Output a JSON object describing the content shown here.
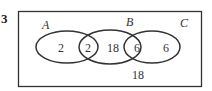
{
  "question_number": "3",
  "sets": [
    {
      "label": "A",
      "cx": 67,
      "cy": 47,
      "rx": 31,
      "ry": 16
    },
    {
      "label": "B",
      "cx": 110,
      "cy": 47,
      "rx": 31,
      "ry": 17
    },
    {
      "label": "C",
      "cx": 152,
      "cy": 47,
      "rx": 28,
      "ry": 16
    }
  ],
  "regions": {
    "a_only": "2",
    "a_and_b": "2",
    "b_only": "18",
    "b_and_c": "6",
    "c_only": "6",
    "outside": "18"
  },
  "colors": {
    "stroke": "#333333",
    "text": "#333333",
    "background": "#ffffff"
  }
}
